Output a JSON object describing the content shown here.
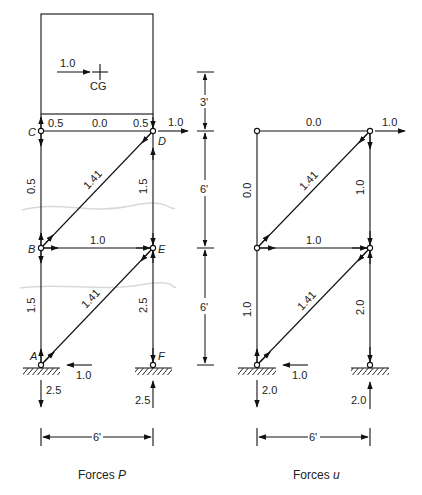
{
  "diagrams": [
    {
      "id": "forces-P",
      "caption_text": "Forces ",
      "caption_var": "P",
      "cg_label": "CG",
      "cg_force": "1.0",
      "joints": {
        "A": "A",
        "B": "B",
        "C": "C",
        "D": "D",
        "E": "E",
        "F": "F"
      },
      "members": {
        "CD_left": "0.5",
        "CD_mid": "0.0",
        "CD_right": "0.5",
        "CB": "0.5",
        "DE": "1.5",
        "BD": "1.41",
        "BE": "1.0",
        "BA": "1.5",
        "EF": "2.5",
        "AE": "1.41"
      },
      "loads": {
        "D_horizontal": "1.0",
        "A_horizontal": "1.0",
        "A_vertical": "2.5",
        "F_vertical": "2.5"
      },
      "width_dim": "6'"
    },
    {
      "id": "forces-u",
      "caption_text": "Forces ",
      "caption_var": "u",
      "members": {
        "top": "0.0",
        "left_upper": "0.0",
        "right_upper": "1.0",
        "diag_upper": "1.41",
        "middle": "1.0",
        "left_lower": "1.0",
        "right_lower": "2.0",
        "diag_lower": "1.41"
      },
      "loads": {
        "top_right_horizontal": "1.0",
        "bottom_left_horizontal": "1.0",
        "bottom_left_vertical": "2.0",
        "bottom_right_vertical": "2.0"
      },
      "width_dim": "6'"
    }
  ],
  "height_dims": [
    "3'",
    "6'",
    "6'"
  ]
}
